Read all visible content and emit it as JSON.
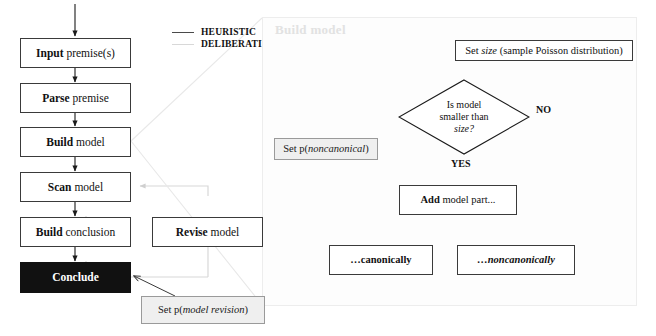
{
  "legend": {
    "items": [
      {
        "label": "HEURISTIC",
        "color": "#4a4a4a"
      },
      {
        "label": "DELIBERATIVE",
        "color": "#d8d8d8"
      }
    ]
  },
  "left_flow": {
    "nodes": [
      {
        "id": "input",
        "bold": "Input",
        "rest": " premise(s)"
      },
      {
        "id": "parse",
        "bold": "Parse",
        "rest": " premise"
      },
      {
        "id": "build",
        "bold": "Build",
        "rest": " model"
      },
      {
        "id": "scan",
        "bold": "Scan",
        "rest": " model"
      },
      {
        "id": "buildconc",
        "bold": "Build",
        "rest": " conclusion"
      },
      {
        "id": "conclude",
        "bold": "Conclude",
        "rest": ""
      }
    ],
    "revise": {
      "bold": "Revise",
      "rest": " model"
    },
    "param_model_revision": {
      "pre": "Set p(",
      "em": "model revision",
      "post": ")"
    }
  },
  "panel": {
    "title": "Build model",
    "set_size": {
      "pre": "Set ",
      "em": "size",
      "post": " (sample Poisson distribution)"
    },
    "decision": {
      "line1": "Is model",
      "line2": "smaller than",
      "line3": "size?"
    },
    "branch_no": "NO",
    "branch_yes": "YES",
    "param_noncanonical": {
      "pre": "Set p(",
      "em": "noncanonical",
      "post": ")"
    },
    "add_part": {
      "bold": "Add",
      "rest": "  model part..."
    },
    "canonically": "…canonically",
    "noncanonically": "…noncanonically"
  },
  "colors": {
    "heuristic": "#4a4a4a",
    "deliberative": "#d8d8d8",
    "node_border": "#3a3a3a",
    "conclude_fill": "#111111",
    "param_fill": "#efefef",
    "param_border": "#9a9a9a",
    "panel_border": "#ededed",
    "panel_title": "#e2e2e2"
  }
}
